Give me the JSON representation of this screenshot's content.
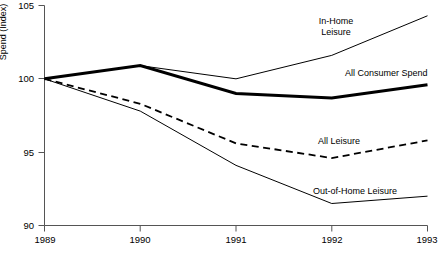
{
  "axes": {
    "ylabel": "Spend (Index)",
    "yticks": [
      "105",
      "100",
      "95",
      "90"
    ],
    "xticks": [
      "1989",
      "1990",
      "1991",
      "1992",
      "1993"
    ]
  },
  "labels": {
    "in_home": "In-Home\nLeisure",
    "all_consumer": "All Consumer Spend",
    "all_leisure": "All Leisure",
    "out_of_home": "Out-of-Home Leisure"
  },
  "chart_data": {
    "type": "line",
    "title": "",
    "xlabel": "",
    "ylabel": "Spend (Index)",
    "x": [
      1989,
      1990,
      1991,
      1992,
      1993
    ],
    "categories": [
      "1989",
      "1990",
      "1991",
      "1992",
      "1993"
    ],
    "ylim": [
      90,
      105
    ],
    "xlim": [
      1989,
      1993
    ],
    "grid": false,
    "legend": "inline-annotations",
    "series": [
      {
        "name": "In-Home Leisure",
        "values": [
          100.0,
          100.9,
          100.0,
          101.6,
          104.3
        ],
        "style": "solid",
        "width": 1,
        "color": "#000000"
      },
      {
        "name": "All Consumer Spend",
        "values": [
          100.0,
          100.9,
          99.0,
          98.7,
          99.6
        ],
        "style": "solid",
        "width": 3,
        "color": "#000000"
      },
      {
        "name": "All Leisure",
        "values": [
          100.0,
          98.3,
          95.6,
          94.6,
          95.8
        ],
        "style": "dashed",
        "width": 1.8,
        "color": "#000000"
      },
      {
        "name": "Out-of-Home Leisure",
        "values": [
          100.0,
          97.8,
          94.1,
          91.5,
          92.0
        ],
        "style": "solid",
        "width": 1,
        "color": "#000000"
      }
    ]
  }
}
